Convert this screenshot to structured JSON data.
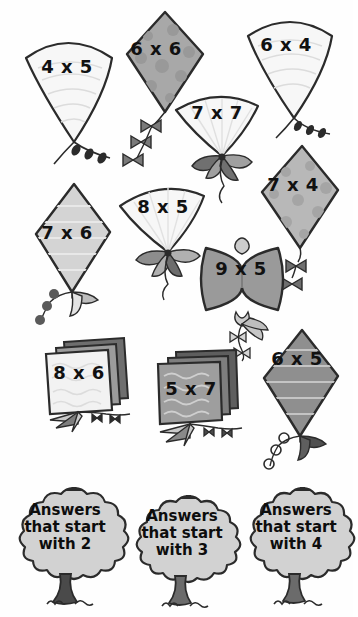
{
  "worksheet": {
    "title": "Multiplication kites sorting worksheet",
    "colors": {
      "outline": "#2b2b2b",
      "white_fill": "#f7f7f7",
      "light_gray": "#d7d7d7",
      "mid_gray": "#b4b4b4",
      "dark_gray": "#8f8f8f",
      "darker_gray": "#6e6e6e",
      "trunk": "#4a4a4a",
      "text": "#111111"
    },
    "kites": [
      {
        "id": "kite-4x5",
        "label": "4 x 5",
        "shape": "cone",
        "fill": "white_fill",
        "x": 18,
        "y": 32,
        "w": 95,
        "h": 120,
        "label_x": 24,
        "label_y": 56,
        "label_w": 86,
        "size": "f18"
      },
      {
        "id": "kite-6x6",
        "label": "6 x 6",
        "shape": "diamond",
        "fill": "dark_gray",
        "x": 115,
        "y": 8,
        "w": 80,
        "h": 110,
        "label_x": 120,
        "label_y": 38,
        "label_w": 72,
        "size": "f18",
        "dots": true
      },
      {
        "id": "kite-6x4",
        "label": "6 x 4",
        "shape": "cone",
        "fill": "white_fill",
        "x": 242,
        "y": 14,
        "w": 88,
        "h": 108,
        "label_x": 246,
        "label_y": 34,
        "label_w": 80,
        "size": "f18"
      },
      {
        "id": "kite-7x7",
        "label": "7 x 7",
        "shape": "fan",
        "fill": "white_fill",
        "x": 172,
        "y": 88,
        "w": 88,
        "h": 72,
        "label_x": 178,
        "label_y": 102,
        "label_w": 78,
        "size": "f18"
      },
      {
        "id": "kite-7x4",
        "label": "7 x 4",
        "shape": "diamond",
        "fill": "mid_gray",
        "x": 250,
        "y": 142,
        "w": 86,
        "h": 108,
        "label_x": 254,
        "label_y": 174,
        "label_w": 78,
        "size": "f18",
        "dots": true
      },
      {
        "id": "kite-7x6",
        "label": "7 x 6",
        "shape": "diamond",
        "fill": "light_gray",
        "x": 28,
        "y": 180,
        "w": 78,
        "h": 110,
        "label_x": 30,
        "label_y": 222,
        "label_w": 74,
        "size": "f18"
      },
      {
        "id": "kite-8x5",
        "label": "8 x 5",
        "shape": "fan",
        "fill": "white_fill",
        "x": 118,
        "y": 182,
        "w": 88,
        "h": 72,
        "label_x": 124,
        "label_y": 196,
        "label_w": 78,
        "size": "f18"
      },
      {
        "id": "kite-9x5",
        "label": "9 x 5",
        "shape": "butterfly",
        "fill": "dark_gray",
        "x": 192,
        "y": 236,
        "w": 98,
        "h": 80,
        "label_x": 198,
        "label_y": 258,
        "label_w": 86,
        "size": "f18"
      },
      {
        "id": "kite-8x6",
        "label": "8 x 6",
        "shape": "square",
        "fill": "white_fill",
        "x": 40,
        "y": 336,
        "w": 82,
        "h": 78,
        "label_x": 42,
        "label_y": 362,
        "label_w": 74,
        "size": "f18"
      },
      {
        "id": "kite-5x7",
        "label": "5 x 7",
        "shape": "square",
        "fill": "dark_gray",
        "x": 152,
        "y": 348,
        "w": 82,
        "h": 78,
        "label_x": 154,
        "label_y": 378,
        "label_w": 74,
        "size": "f18"
      },
      {
        "id": "kite-6x5",
        "label": "6 x 5",
        "shape": "diamond",
        "fill": "dark_gray",
        "x": 258,
        "y": 326,
        "w": 78,
        "h": 108,
        "label_x": 260,
        "label_y": 348,
        "label_w": 74,
        "size": "f18"
      }
    ],
    "trees": [
      {
        "id": "tree-answers-2",
        "line1": "Answers",
        "line2": "that start",
        "line3": "with 2",
        "x": 5,
        "y": 484,
        "w": 120,
        "h": 128
      },
      {
        "id": "tree-answers-3",
        "line1": "Answers",
        "line2": "that start",
        "line3": "with 3",
        "x": 124,
        "y": 492,
        "w": 112,
        "h": 120
      },
      {
        "id": "tree-answers-4",
        "line1": "Answers",
        "line2": "that start",
        "line3": "with 4",
        "x": 238,
        "y": 484,
        "w": 112,
        "h": 128
      }
    ]
  }
}
